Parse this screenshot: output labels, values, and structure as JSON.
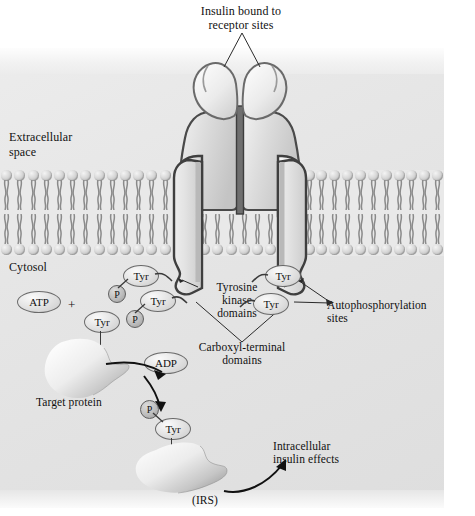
{
  "figure": {
    "type": "biological-signaling-diagram",
    "credit": "From Lehninger, Principles of Biochemistry, Second Edition, by David L. Nelson and Michael M. Cox. © 1982, 1992 by Worth Publishers.\nUsed with permission of W. H. Freeman and Company."
  },
  "labels": {
    "insulin_bound": "Insulin bound to\nreceptor sites",
    "extracellular": "Extracellular\nspace",
    "cytosol": "Cytosol",
    "tyrosine_kinase": "Tyrosine\nkinase\ndomains",
    "carboxyl_terminal": "Carboxyl-terminal\ndomains",
    "autophosphorylation": "Autophosphorylation\nsites",
    "target_protein": "Target protein",
    "irs": "(IRS)",
    "intracellular_effects": "Intracellular\ninsulin effects"
  },
  "subunits": {
    "alpha_left": "α",
    "alpha_right": "α",
    "beta_left": "β",
    "beta_right": "β"
  },
  "molecules": {
    "atp": "ATP",
    "adp": "ADP",
    "plus": "+",
    "tyr": "Tyr",
    "p": "P"
  },
  "residues": [
    {
      "id": "tyr-left-upper",
      "label": "Tyr",
      "phospho": "P"
    },
    {
      "id": "tyr-left-lower",
      "label": "Tyr",
      "phospho": "P"
    },
    {
      "id": "tyr-right-upper",
      "label": "Tyr",
      "phospho": null
    },
    {
      "id": "tyr-right-lower",
      "label": "Tyr",
      "phospho": null
    },
    {
      "id": "tyr-target",
      "label": "Tyr",
      "phospho": null
    },
    {
      "id": "tyr-irs",
      "label": "Tyr",
      "phospho": "P"
    }
  ],
  "colors": {
    "panel_bg": "#e6e6e6",
    "membrane_head": "#d2d2d2",
    "receptor_fill": "#d8d8d8",
    "receptor_outline": "#4a4a4a",
    "text": "#111111",
    "credit_text": "#8d8d8d"
  }
}
